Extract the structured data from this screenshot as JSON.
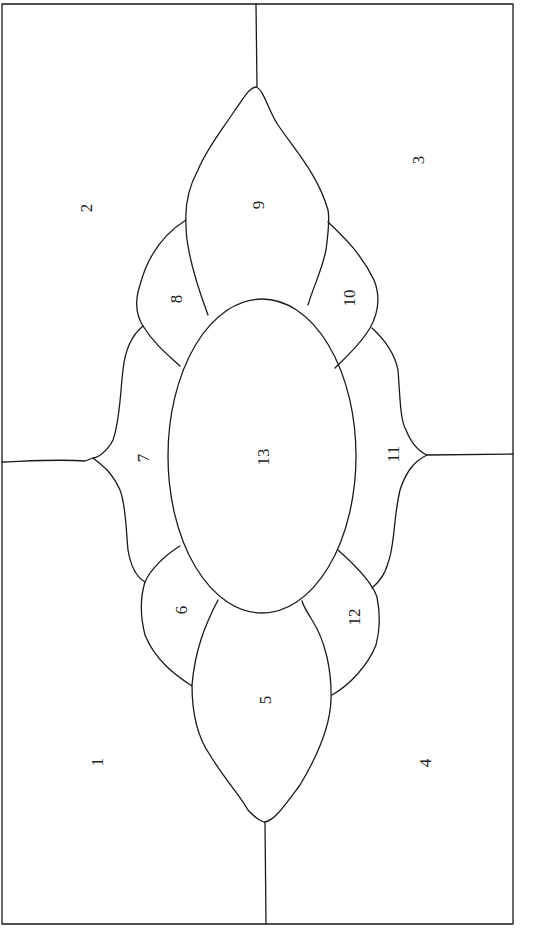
{
  "diagram": {
    "type": "stained-glass pattern outline",
    "line_color": "#1a1a1a",
    "background": "#ffffff",
    "label_orientation": "rotated -90deg",
    "regions": [
      {
        "id": 1,
        "label": "1",
        "x": 97,
        "y": 762
      },
      {
        "id": 2,
        "label": "2",
        "x": 86,
        "y": 208
      },
      {
        "id": 3,
        "label": "3",
        "x": 418,
        "y": 160
      },
      {
        "id": 4,
        "label": "4",
        "x": 425,
        "y": 763
      },
      {
        "id": 5,
        "label": "5",
        "x": 265,
        "y": 700
      },
      {
        "id": 6,
        "label": "6",
        "x": 181,
        "y": 610
      },
      {
        "id": 7,
        "label": "7",
        "x": 143,
        "y": 458
      },
      {
        "id": 8,
        "label": "8",
        "x": 176,
        "y": 299
      },
      {
        "id": 9,
        "label": "9",
        "x": 258,
        "y": 205
      },
      {
        "id": 10,
        "label": "10",
        "x": 349,
        "y": 298
      },
      {
        "id": 11,
        "label": "11",
        "x": 393,
        "y": 454
      },
      {
        "id": 12,
        "label": "12",
        "x": 354,
        "y": 617
      },
      {
        "id": 13,
        "label": "13",
        "x": 263,
        "y": 457
      }
    ]
  }
}
